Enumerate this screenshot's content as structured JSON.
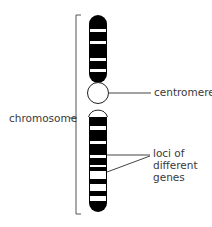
{
  "diagram": {
    "labels": {
      "chromosome": "chromosome",
      "centromere": "centromere",
      "loci_line1": "loci of",
      "loci_line2": "different",
      "loci_line3": "genes"
    },
    "colors": {
      "band_dark": "#000000",
      "band_light": "#ffffff",
      "line": "#444444",
      "text": "#3a3a3a"
    }
  }
}
